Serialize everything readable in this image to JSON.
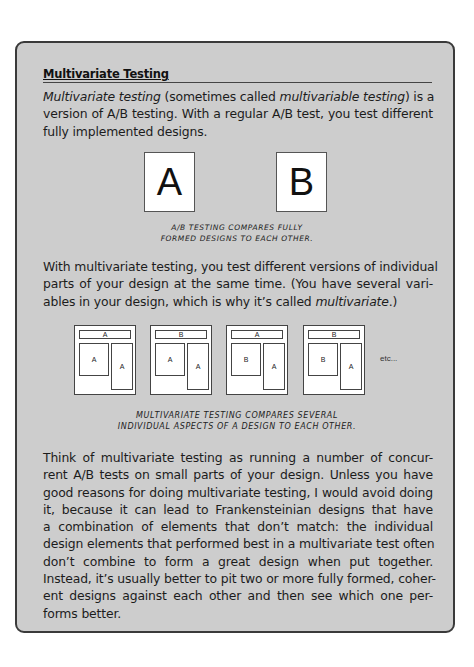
{
  "sidebar": {
    "heading": "Multivariate Testing",
    "intro_lines": [
      {
        "segments": [
          {
            "text": "Multivariate testing",
            "italic": true
          },
          {
            "text": " (sometimes called ",
            "italic": false
          },
          {
            "text": "multivariable testing",
            "italic": true
          },
          {
            "text": ") is a",
            "italic": false
          }
        ]
      },
      {
        "segments": [
          {
            "text": "version of A/B testing. With a regular A/B test, you test different",
            "italic": false
          }
        ]
      },
      {
        "segments": [
          {
            "text": "fully implemented designs.",
            "italic": false
          }
        ]
      }
    ],
    "ab_figure": {
      "box_a": "A",
      "box_b": "B",
      "caption_line1": "A/B testing compares fully",
      "caption_line2": "formed designs to each other."
    },
    "multivariate_lines": [
      {
        "segments": [
          {
            "text": "With multivariate testing, you test different versions of individual",
            "italic": false
          }
        ]
      },
      {
        "segments": [
          {
            "text": "parts of your design at the same time. (You have several vari-",
            "italic": false
          }
        ]
      },
      {
        "segments": [
          {
            "text": "ables in your design, which is why it’s called ",
            "italic": false
          },
          {
            "text": "multivariate",
            "italic": true
          },
          {
            "text": ".)",
            "italic": false
          }
        ]
      }
    ],
    "mv_figure": {
      "mockups": [
        {
          "header": "A",
          "left": "A",
          "right": "A"
        },
        {
          "header": "B",
          "left": "A",
          "right": "A"
        },
        {
          "header": "A",
          "left": "B",
          "right": "A"
        },
        {
          "header": "B",
          "left": "B",
          "right": "A"
        }
      ],
      "etc": "etc...",
      "caption_line1": "Multivariate testing compares several",
      "caption_line2": "individual aspects of a design to each other."
    },
    "closing_lines": [
      "Think of multivariate testing as running a number of concur-",
      "rent A/B tests on small parts of your design. Unless you have",
      "good reasons for doing multivariate testing, I would avoid doing",
      "it, because it can lead to Frankensteinian designs that have",
      "a combination of elements that don’t match: the individual",
      "design elements that performed best in a multivariate test often",
      "don’t combine to form a great design when put together.",
      "Instead, it’s usually better to pit two or more fully formed, coher-",
      "ent designs against each other and then see which one per-",
      "forms better."
    ]
  },
  "colors": {
    "box_background": "#cdcdcd",
    "box_border": "#3a3a3a",
    "text": "#1c1c1c"
  }
}
